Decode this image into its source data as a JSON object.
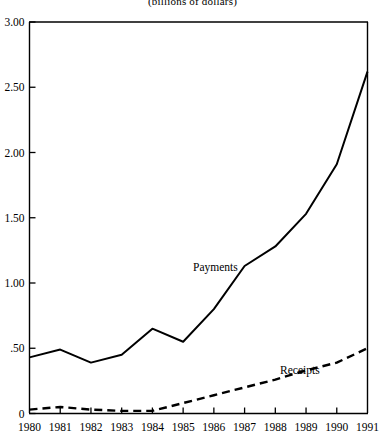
{
  "chart_data": {
    "type": "line",
    "title": "(billions of dollars)",
    "xlabel": "",
    "ylabel": "",
    "x": [
      1980,
      1981,
      1982,
      1983,
      1984,
      1985,
      1986,
      1987,
      1988,
      1989,
      1990,
      1991
    ],
    "xtick_labels": [
      "1980",
      "1981",
      "1982",
      "1983",
      "1984",
      "1985",
      "1986",
      "1987",
      "1988",
      "1989",
      "1990",
      "1991"
    ],
    "ytick_labels": [
      "0",
      ".50",
      "1.00",
      "1.50",
      "2.00",
      "2.50",
      "3.00"
    ],
    "ytick_values": [
      0,
      0.5,
      1.0,
      1.5,
      2.0,
      2.5,
      3.0
    ],
    "xlim": [
      1980,
      1991
    ],
    "ylim": [
      0,
      3.0
    ],
    "grid": false,
    "legend": "inline-annotations",
    "series": [
      {
        "name": "Payments",
        "style": "solid",
        "color": "#000000",
        "label_x": 1986.05,
        "label_y": 1.09,
        "values": [
          0.43,
          0.49,
          0.39,
          0.45,
          0.65,
          0.55,
          0.8,
          1.13,
          1.28,
          1.53,
          1.91,
          2.62
        ]
      },
      {
        "name": "Receipts",
        "style": "dashed",
        "color": "#000000",
        "label_x": 1988.8,
        "label_y": 0.3,
        "values": [
          0.03,
          0.05,
          0.03,
          0.02,
          0.02,
          0.08,
          0.14,
          0.2,
          0.26,
          0.33,
          0.39,
          0.5
        ]
      }
    ]
  }
}
